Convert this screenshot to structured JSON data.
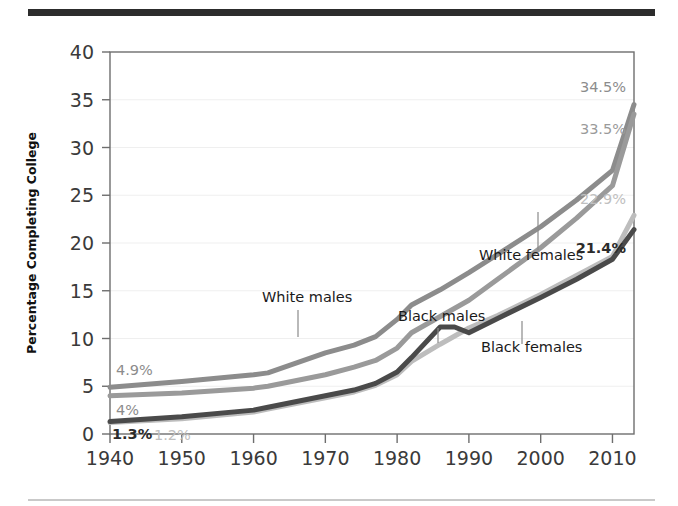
{
  "figure": {
    "top_rule_color": "#2c2c2c",
    "bottom_rule_color": "#c9c9c9",
    "background": "#ffffff"
  },
  "chart_data": {
    "type": "line",
    "title": "",
    "subtitle": "",
    "xlabel": "",
    "ylabel": "Percentage Completing College",
    "xlim": [
      1940,
      2013
    ],
    "ylim": [
      0,
      40
    ],
    "xticks": [
      1940,
      1950,
      1960,
      1970,
      1980,
      1990,
      2000,
      2010
    ],
    "yticks": [
      0,
      5,
      10,
      15,
      20,
      25,
      30,
      35,
      40
    ],
    "grid": true,
    "legend_position": "inline-annotations",
    "series": [
      {
        "name": "White males",
        "color": "#8c8c8c",
        "annotation": "White males",
        "start_label": "4.9%",
        "end_label": "34.5%",
        "start_label_bold": false,
        "end_label_bold": false,
        "start_label_color": "#8c8c8c",
        "end_label_color": "#8c8c8c",
        "x": [
          1940,
          1950,
          1960,
          1962,
          1970,
          1974,
          1977,
          1980,
          1982,
          1986,
          1990,
          1994,
          2000,
          2005,
          2010,
          2013
        ],
        "values": [
          4.9,
          5.5,
          6.2,
          6.4,
          8.5,
          9.3,
          10.2,
          12.0,
          13.5,
          15.1,
          16.9,
          18.8,
          21.7,
          24.5,
          27.6,
          34.5
        ]
      },
      {
        "name": "White females",
        "color": "#9a9a9a",
        "annotation": "White females",
        "start_label": "4%",
        "end_label": "33.5%",
        "start_label_bold": false,
        "end_label_bold": false,
        "start_label_color": "#8c8c8c",
        "end_label_color": "#9a9a9a",
        "x": [
          1940,
          1950,
          1960,
          1962,
          1970,
          1974,
          1977,
          1980,
          1982,
          1986,
          1990,
          1994,
          2000,
          2005,
          2010,
          2013
        ],
        "values": [
          4.0,
          4.3,
          4.8,
          5.0,
          6.2,
          7.0,
          7.7,
          9.0,
          10.6,
          12.3,
          14.0,
          16.2,
          19.5,
          22.6,
          26.0,
          33.5
        ]
      },
      {
        "name": "Black females",
        "color": "#bdbdbd",
        "annotation": "Black females",
        "start_label": "1.2%",
        "end_label": "22.9%",
        "start_label_bold": false,
        "end_label_bold": false,
        "start_label_color": "#c0c0c0",
        "end_label_color": "#c0c0c0",
        "x": [
          1940,
          1950,
          1960,
          1962,
          1970,
          1974,
          1977,
          1980,
          1982,
          1986,
          1990,
          1994,
          2000,
          2005,
          2010,
          2013
        ],
        "values": [
          1.2,
          1.6,
          2.3,
          2.6,
          3.8,
          4.4,
          5.1,
          6.2,
          7.6,
          9.4,
          11.1,
          12.4,
          14.6,
          16.6,
          18.6,
          22.9
        ]
      },
      {
        "name": "Black males",
        "color": "#4a4a4a",
        "annotation": "Black males",
        "start_label": "1.3%",
        "end_label": "21.4%",
        "start_label_bold": true,
        "end_label_bold": true,
        "start_label_color": "#2b2b2b",
        "end_label_color": "#2b2b2b",
        "x": [
          1940,
          1950,
          1960,
          1962,
          1970,
          1974,
          1977,
          1980,
          1982,
          1986,
          1988,
          1990,
          1994,
          2000,
          2005,
          2010,
          2013
        ],
        "values": [
          1.3,
          1.8,
          2.5,
          2.8,
          4.0,
          4.6,
          5.3,
          6.5,
          8.0,
          11.2,
          11.2,
          10.6,
          12.1,
          14.3,
          16.2,
          18.3,
          21.4
        ]
      }
    ],
    "annotations": [
      {
        "text": "White males",
        "text_x": 262,
        "text_y": 302,
        "leader_x": 298,
        "leader_y1": 310,
        "leader_y2": 337
      },
      {
        "text": "Black males",
        "text_x": 398,
        "text_y": 321,
        "leader_x": 438,
        "leader_y1": 328,
        "leader_y2": 343
      },
      {
        "text": "White females",
        "text_x": 479,
        "text_y": 260,
        "leader_x": 538,
        "leader_y1": 250,
        "leader_y2": 212
      },
      {
        "text": "Black females",
        "text_x": 481,
        "text_y": 352,
        "leader_x": 522,
        "leader_y1": 344,
        "leader_y2": 321
      }
    ]
  }
}
